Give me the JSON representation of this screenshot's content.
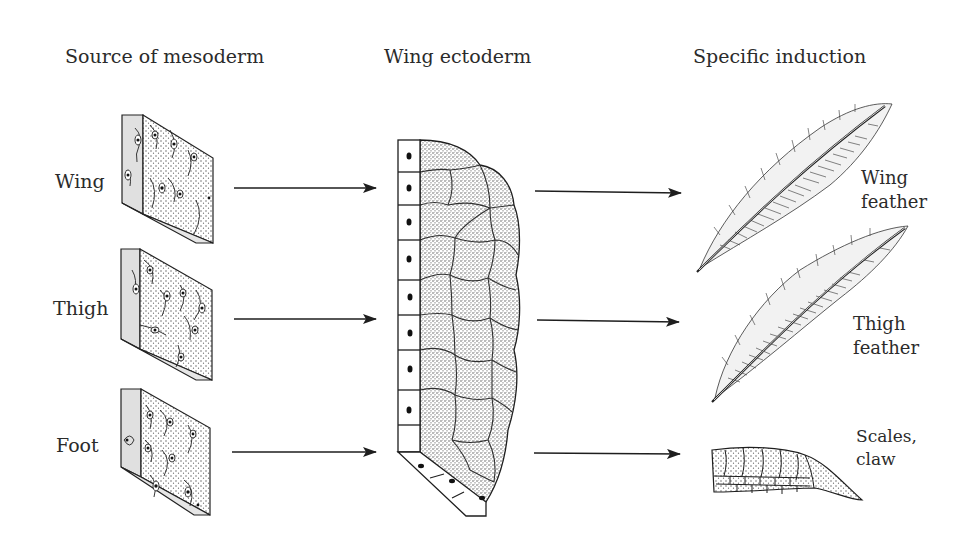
{
  "diagram": {
    "columns": [
      {
        "id": "source",
        "header": "Source of mesoderm"
      },
      {
        "id": "ectoderm",
        "header": "Wing ectoderm"
      },
      {
        "id": "induction",
        "header": "Specific induction"
      }
    ],
    "rows": [
      {
        "source_label": "Wing",
        "result_label_line1": "Wing",
        "result_label_line2": "feather",
        "result_type": "wing-feather"
      },
      {
        "source_label": "Thigh",
        "result_label_line1": "Thigh",
        "result_label_line2": "feather",
        "result_type": "thigh-feather"
      },
      {
        "source_label": "Foot",
        "result_label_line1": "Scales,",
        "result_label_line2": "claw",
        "result_type": "scales-claw"
      }
    ],
    "arrows": [
      {
        "from": "wing-mesoderm",
        "to": "wing-ectoderm"
      },
      {
        "from": "thigh-mesoderm",
        "to": "wing-ectoderm"
      },
      {
        "from": "foot-mesoderm",
        "to": "wing-ectoderm"
      },
      {
        "from": "wing-ectoderm",
        "to": "wing-feather"
      },
      {
        "from": "wing-ectoderm",
        "to": "thigh-feather"
      },
      {
        "from": "wing-ectoderm",
        "to": "scales-claw"
      }
    ],
    "colors": {
      "ink": "#1e1e1e",
      "block_side": "#e2e2e2",
      "stipple": "#9a9a9a",
      "background": "#ffffff"
    }
  }
}
